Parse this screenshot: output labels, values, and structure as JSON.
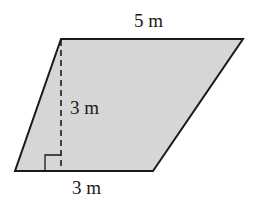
{
  "diagram": {
    "shape": "parallelogram",
    "fill_color": "#d6d6d6",
    "stroke_color": "#1a1a1a",
    "labels": {
      "top_side": "5 m",
      "height": "3 m",
      "bottom_side": "3 m"
    },
    "vertices": {
      "top_left": [
        61,
        39
      ],
      "top_right": [
        243,
        39
      ],
      "bottom_right": [
        153,
        171
      ],
      "bottom_left": [
        15,
        171
      ]
    },
    "height_line": {
      "style": "dashed",
      "x": 61,
      "y1": 39,
      "y2": 171
    },
    "right_angle_marker": true
  }
}
